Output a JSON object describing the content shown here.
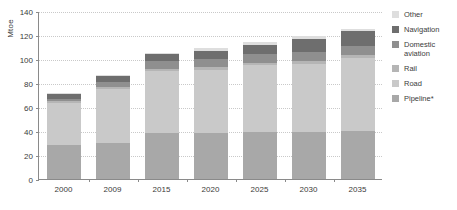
{
  "chart_data": {
    "type": "bar",
    "stacked": true,
    "title": "",
    "xlabel": "",
    "ylabel": "Mtoe",
    "ylim": [
      0,
      140
    ],
    "ytick_step": 20,
    "yticks": [
      0,
      20,
      40,
      60,
      80,
      100,
      120,
      140
    ],
    "grid": true,
    "legend_position": "right",
    "categories": [
      "2000",
      "2009",
      "2015",
      "2020",
      "2025",
      "2030",
      "2035"
    ],
    "series": [
      {
        "name": "Pipeline*",
        "color": "#a8a8a8",
        "values": [
          28,
          30,
          38,
          38,
          39,
          39,
          40
        ]
      },
      {
        "name": "Road",
        "color": "#c9c9c9",
        "values": [
          35,
          45,
          52,
          53,
          56,
          57,
          61
        ]
      },
      {
        "name": "Rail",
        "color": "#b5b5b5",
        "values": [
          2,
          2,
          2,
          2,
          2,
          2,
          2
        ]
      },
      {
        "name": "Domestic aviation",
        "color": "#8f8f8f",
        "values": [
          2,
          4,
          6,
          7,
          7,
          8,
          8
        ]
      },
      {
        "name": "Navigation",
        "color": "#6e6e6e",
        "values": [
          4,
          5,
          6,
          7,
          8,
          11,
          12
        ]
      },
      {
        "name": "Other",
        "color": "#dedede",
        "values": [
          1,
          1,
          1,
          2,
          2,
          2,
          2
        ]
      }
    ],
    "totals": [
      72,
      87,
      105,
      109,
      114,
      119,
      125
    ]
  },
  "legend": {
    "items": [
      {
        "label": "Other",
        "color": "#dedede"
      },
      {
        "label": "Navigation",
        "color": "#6e6e6e"
      },
      {
        "label": "Domestic\naviation",
        "color": "#8f8f8f"
      },
      {
        "label": "Rail",
        "color": "#b5b5b5"
      },
      {
        "label": "Road",
        "color": "#c9c9c9"
      },
      {
        "label": "Pipeline*",
        "color": "#a8a8a8"
      }
    ]
  },
  "axes": {
    "y_label": "Mtoe"
  }
}
